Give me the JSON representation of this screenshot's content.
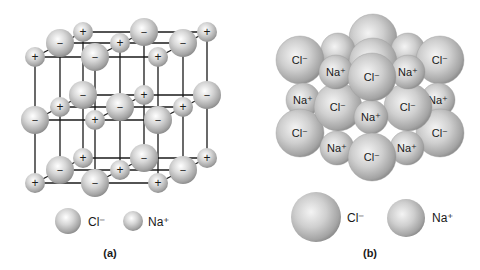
{
  "panel_a": {
    "caption": "(a)",
    "title": "Ball-and-stick model of NaCl lattice",
    "legend": [
      {
        "label": "Cl⁻",
        "ion": "chloride"
      },
      {
        "label": "Na⁺",
        "ion": "sodium"
      }
    ],
    "layers": [
      {
        "name": "top",
        "ions": [
          {
            "x": 35,
            "y": 57,
            "s": "+"
          },
          {
            "x": 60,
            "y": 43,
            "s": "−"
          },
          {
            "x": 83,
            "y": 32,
            "s": "+"
          },
          {
            "x": 95,
            "y": 57,
            "s": "−"
          },
          {
            "x": 120,
            "y": 43,
            "s": "+"
          },
          {
            "x": 144,
            "y": 32,
            "s": "−"
          },
          {
            "x": 158,
            "y": 57,
            "s": "+"
          },
          {
            "x": 183,
            "y": 43,
            "s": "−"
          },
          {
            "x": 207,
            "y": 32,
            "s": "+"
          }
        ]
      },
      {
        "name": "middle",
        "ions": [
          {
            "x": 35,
            "y": 120,
            "s": "−"
          },
          {
            "x": 60,
            "y": 107,
            "s": "+"
          },
          {
            "x": 83,
            "y": 95,
            "s": "−"
          },
          {
            "x": 95,
            "y": 120,
            "s": "+"
          },
          {
            "x": 120,
            "y": 107,
            "s": "−"
          },
          {
            "x": 144,
            "y": 95,
            "s": "+"
          },
          {
            "x": 158,
            "y": 120,
            "s": "−"
          },
          {
            "x": 183,
            "y": 107,
            "s": "+"
          },
          {
            "x": 207,
            "y": 95,
            "s": "−"
          }
        ]
      },
      {
        "name": "bottom",
        "ions": [
          {
            "x": 35,
            "y": 183,
            "s": "+"
          },
          {
            "x": 60,
            "y": 170,
            "s": "−"
          },
          {
            "x": 83,
            "y": 158,
            "s": "+"
          },
          {
            "x": 95,
            "y": 183,
            "s": "−"
          },
          {
            "x": 120,
            "y": 170,
            "s": "+"
          },
          {
            "x": 144,
            "y": 158,
            "s": "−"
          },
          {
            "x": 158,
            "y": 183,
            "s": "+"
          },
          {
            "x": 183,
            "y": 170,
            "s": "−"
          },
          {
            "x": 207,
            "y": 158,
            "s": "+"
          }
        ]
      }
    ]
  },
  "panel_b": {
    "caption": "(b)",
    "title": "Space-filling model of NaCl",
    "legend": [
      {
        "label": "Cl⁻",
        "ion": "chloride"
      },
      {
        "label": "Na⁺",
        "ion": "sodium"
      }
    ],
    "ions": [
      {
        "x": 373,
        "y": 38,
        "r": 24,
        "label": ""
      },
      {
        "x": 338,
        "y": 50,
        "r": 17,
        "label": ""
      },
      {
        "x": 408,
        "y": 50,
        "r": 17,
        "label": ""
      },
      {
        "x": 373,
        "y": 62,
        "r": 24,
        "label": ""
      },
      {
        "x": 300,
        "y": 60,
        "r": 24,
        "label": "Cl⁻"
      },
      {
        "x": 440,
        "y": 60,
        "r": 24,
        "label": "Cl⁻"
      },
      {
        "x": 303,
        "y": 100,
        "r": 17,
        "label": "Na⁺"
      },
      {
        "x": 438,
        "y": 100,
        "r": 17,
        "label": "Na⁺"
      },
      {
        "x": 300,
        "y": 133,
        "r": 24,
        "label": "Cl⁻"
      },
      {
        "x": 440,
        "y": 133,
        "r": 24,
        "label": "Cl⁻"
      },
      {
        "x": 338,
        "y": 107,
        "r": 24,
        "label": "Cl⁻"
      },
      {
        "x": 408,
        "y": 107,
        "r": 24,
        "label": "Cl⁻"
      },
      {
        "x": 337,
        "y": 148,
        "r": 17,
        "label": "Na⁺"
      },
      {
        "x": 407,
        "y": 148,
        "r": 17,
        "label": "Na⁺"
      },
      {
        "x": 336,
        "y": 72,
        "r": 17,
        "label": "Na⁺"
      },
      {
        "x": 408,
        "y": 72,
        "r": 17,
        "label": "Na⁺"
      },
      {
        "x": 371,
        "y": 117,
        "r": 17,
        "label": "Na⁺"
      },
      {
        "x": 372,
        "y": 157,
        "r": 24,
        "label": "Cl⁻"
      },
      {
        "x": 372,
        "y": 77,
        "r": 24,
        "label": "Cl⁻"
      }
    ]
  },
  "colors": {
    "sphere_highlight": "#ffffff",
    "sphere_mid": "#c8c8c8",
    "sphere_shadow": "#8a8a8a",
    "line": "#1a1a1a",
    "text": "#1a1a1a"
  }
}
